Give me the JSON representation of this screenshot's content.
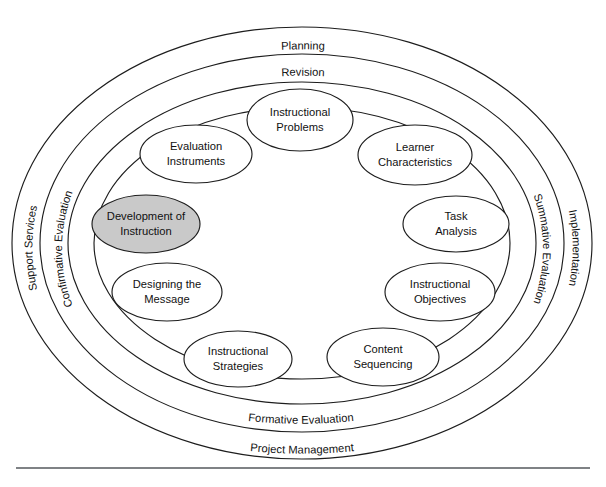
{
  "diagram": {
    "colors": {
      "stroke": "#1d1d1d",
      "background": "#ffffff",
      "highlight_fill": "#c9c9c9",
      "node_fill": "#ffffff",
      "rule": "#55595c"
    },
    "rings": [
      {
        "id": "ring-outer",
        "top_label": "Planning",
        "bottom_label": "Project Management",
        "left_label": "Support Services",
        "right_label": "Implementation"
      },
      {
        "id": "ring-middle",
        "top_label": "Revision",
        "bottom_label": "Formative Evaluation",
        "left_label": "Confirmative Evaluation",
        "right_label": "Summative Evaluation"
      }
    ],
    "ring_labels": {
      "planning": "Planning",
      "revision": "Revision",
      "support_services": "Support Services",
      "confirmative_evaluation": "Confirmative Evaluation",
      "summative_evaluation": "Summative Evaluation",
      "implementation": "Implementation",
      "formative_evaluation": "Formative Evaluation",
      "project_management": "Project Management"
    },
    "elements": [
      {
        "id": "instructional-problems",
        "line1": "Instructional",
        "line2": "Problems",
        "highlighted": false
      },
      {
        "id": "learner-characteristics",
        "line1": "Learner",
        "line2": "Characteristics",
        "highlighted": false
      },
      {
        "id": "task-analysis",
        "line1": "Task",
        "line2": "Analysis",
        "highlighted": false
      },
      {
        "id": "instructional-objectives",
        "line1": "Instructional",
        "line2": "Objectives",
        "highlighted": false
      },
      {
        "id": "content-sequencing",
        "line1": "Content",
        "line2": "Sequencing",
        "highlighted": false
      },
      {
        "id": "instructional-strategies",
        "line1": "Instructional",
        "line2": "Strategies",
        "highlighted": false
      },
      {
        "id": "designing-the-message",
        "line1": "Designing the",
        "line2": "Message",
        "highlighted": false
      },
      {
        "id": "development-of-instruction",
        "line1": "Development of",
        "line2": "Instruction",
        "highlighted": true
      },
      {
        "id": "evaluation-instruments",
        "line1": "Evaluation",
        "line2": "Instruments",
        "highlighted": false
      }
    ]
  }
}
